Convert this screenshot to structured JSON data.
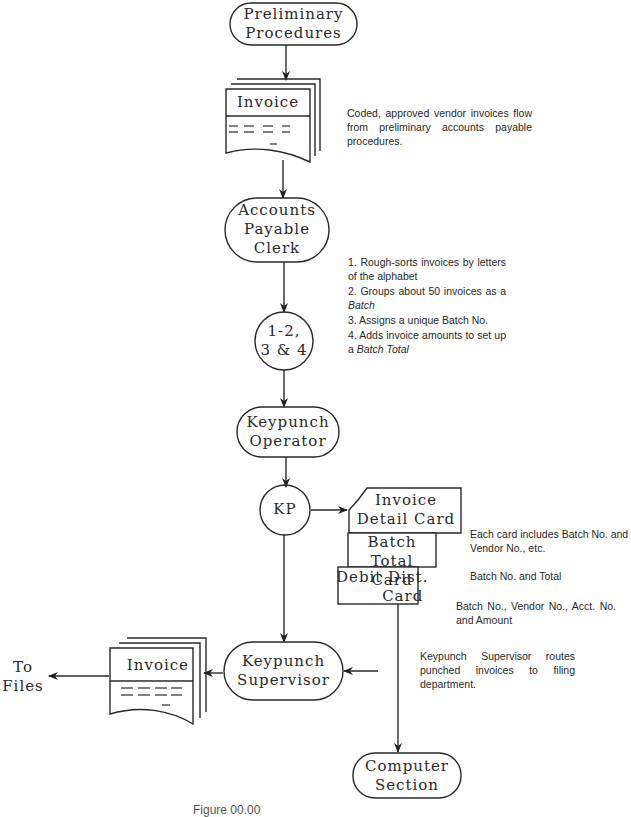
{
  "nodes": {
    "preliminary": {
      "label": "Preliminary\nProcedures"
    },
    "invoice_top": {
      "label": "Invoice"
    },
    "ap_clerk": {
      "label": "Accounts\nPayable\nClerk"
    },
    "steps_connector": {
      "label": "1-2,\n3 & 4"
    },
    "keypunch_operator": {
      "label": "Keypunch\nOperator"
    },
    "kp": {
      "label": "KP"
    },
    "invoice_detail_card": {
      "label": "Invoice\nDetail Card"
    },
    "batch_total_card": {
      "label": "Batch\nTotal Card"
    },
    "debit_dist_card": {
      "label": "Debit Dist.\n        Card"
    },
    "keypunch_supervisor": {
      "label": "Keypunch\nSupervisor"
    },
    "invoice_bottom": {
      "label": "Invoice"
    },
    "to_files": {
      "label": "To\nFiles"
    },
    "computer_section": {
      "label": "Computer\nSection"
    }
  },
  "notes": {
    "invoice_flow": "Coded, approved vendor invoices flow from preliminary accounts payable procedures.",
    "clerk_steps": [
      {
        "num": "1.",
        "text": "Rough-sorts invoices by letters of the alphabet"
      },
      {
        "num": "2.",
        "text_before": "Groups about 50 invoices as a ",
        "text_italic": "Batch",
        "text_after": ""
      },
      {
        "num": "3.",
        "text": "Assigns a unique Batch No."
      },
      {
        "num": "4.",
        "text_before": "Adds invoice amounts to set up a ",
        "text_italic": "Batch Total",
        "text_after": ""
      }
    ],
    "detail_card": "Each card includes Batch No. and Vendor No., etc.",
    "batch_card": "Batch No. and Total",
    "debit_card": "Batch No., Vendor No., Acct. No. and Amount",
    "supervisor": "Keypunch Supervisor routes punched invoices to filing department."
  },
  "caption": "Figure 00.00"
}
